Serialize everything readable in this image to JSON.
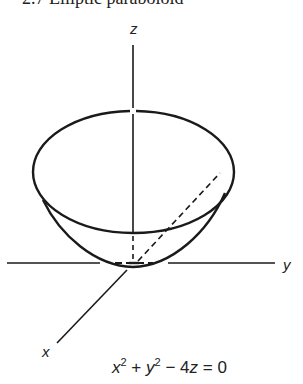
{
  "figure": {
    "caption": "2.7 Elliptic paraboloid",
    "axes": {
      "x_label": "x",
      "y_label": "y",
      "z_label": "z"
    },
    "equation": {
      "terms": [
        "x",
        "2",
        "+",
        "y",
        "2",
        "−",
        "4",
        "z",
        "=",
        "0"
      ],
      "text": "x² + y² − 4z = 0"
    },
    "colors": {
      "stroke": "#1a1a1a",
      "background": "#ffffff"
    }
  }
}
